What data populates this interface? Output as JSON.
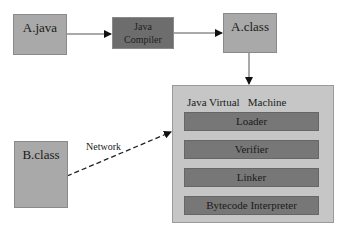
{
  "diagram": {
    "source_a": {
      "label": "A.java"
    },
    "compiler": {
      "line1": "Java",
      "line2": "Compiler"
    },
    "class_a": {
      "label": "A.class"
    },
    "source_b": {
      "label": "B.class"
    },
    "network_label": "Network",
    "jvm": {
      "title": "Java Virtual   Machine",
      "stages": [
        "Loader",
        "Verifier",
        "Linker",
        "Bytecode Interpreter"
      ]
    },
    "colors": {
      "file_box": "#a9a9a9",
      "compiler_box": "#6d6d6d",
      "jvm_box": "#c6c6c6",
      "stage_box": "#777777"
    }
  }
}
